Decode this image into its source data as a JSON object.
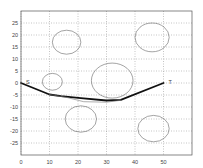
{
  "chart_data": {
    "type": "line",
    "title": "",
    "xlabel": "",
    "ylabel": "",
    "xlim": [
      0,
      60
    ],
    "ylim": [
      -30,
      30
    ],
    "grid": true,
    "legend": null,
    "x_ticks": [
      0,
      10,
      20,
      30,
      40,
      50
    ],
    "y_ticks": [
      25,
      20,
      15,
      10,
      5,
      0,
      -5,
      -10,
      -15,
      -20,
      -25
    ],
    "x_tick_labels": [
      "0",
      "10",
      "20",
      "30",
      "40",
      "50"
    ],
    "y_tick_labels": [
      "25",
      "20",
      "15",
      "10",
      "5",
      "0",
      "-5",
      "-10",
      "-15",
      "-20",
      "-25"
    ],
    "annotations": [
      {
        "text": "S",
        "x": 0,
        "y": 0,
        "role": "start"
      },
      {
        "text": "T",
        "x": 50,
        "y": 0,
        "role": "target"
      }
    ],
    "obstacles": [
      {
        "shape": "circle",
        "cx": 16,
        "cy": 17,
        "r": 5
      },
      {
        "shape": "circle",
        "cx": 46,
        "cy": 19,
        "r": 6
      },
      {
        "shape": "circle",
        "cx": 32,
        "cy": 1,
        "r": 7.3
      },
      {
        "shape": "circle",
        "cx": 11,
        "cy": 0.5,
        "r": 3.5
      },
      {
        "shape": "circle",
        "cx": 21,
        "cy": -15,
        "r": 5.5
      },
      {
        "shape": "circle",
        "cx": 46.5,
        "cy": -19,
        "r": 5.5
      }
    ],
    "series": [
      {
        "name": "planned-path",
        "style": "thick-black",
        "x": [
          0,
          10,
          14,
          21,
          30,
          35,
          50
        ],
        "y": [
          0,
          -4.8,
          -5.5,
          -6.3,
          -7.3,
          -7,
          0
        ]
      },
      {
        "name": "alternate-path",
        "style": "thin-gray",
        "x": [
          10,
          16,
          22,
          30,
          35
        ],
        "y": [
          -4.8,
          -6,
          -7.8,
          -8,
          -7.2
        ]
      }
    ],
    "colors": {
      "axes": "#555555",
      "grid": "#888888",
      "obstacle": "#666666",
      "path": "#111111",
      "alt_path": "#777777"
    }
  }
}
